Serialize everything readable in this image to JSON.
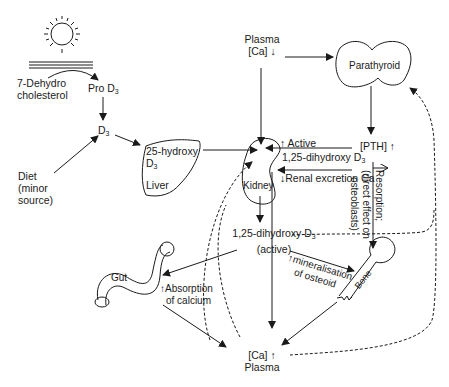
{
  "diagram": {
    "nodes": {
      "sun": "sun",
      "dehydro": [
        "7-Dehydro",
        "cholesterol"
      ],
      "pro_d3": "Pro D",
      "d3": "D",
      "diet": [
        "Diet",
        "(minor",
        "source)"
      ],
      "liver_text": [
        "25-hydroxy",
        "D"
      ],
      "liver": "Liver",
      "plasma_low": [
        "Plasma",
        "[Ca] ↓"
      ],
      "parathyroid": "Parathyroid",
      "pth": "[PTH] ↑",
      "kidney": "Kidney",
      "active_label": "↑ Active",
      "dihydroxy_label": "1,25-dihydroxy D",
      "renal_excretion": "↓Renal excretion Ca",
      "resorption": "Resorption;",
      "direct_effect": "(direct effect on",
      "osteoblasts": "osteoblasts)",
      "active_d3": [
        "1,25-dihydroxy D",
        "(active)"
      ],
      "mineralisation": [
        "↑mineralisation",
        "of osteoid"
      ],
      "bone": "Bone",
      "gut": "Gut",
      "absorption": [
        "↑Absorption",
        "of calcium"
      ],
      "plasma_high": [
        "[Ca] ↑",
        "Plasma"
      ],
      "subscript_3": "3"
    }
  }
}
